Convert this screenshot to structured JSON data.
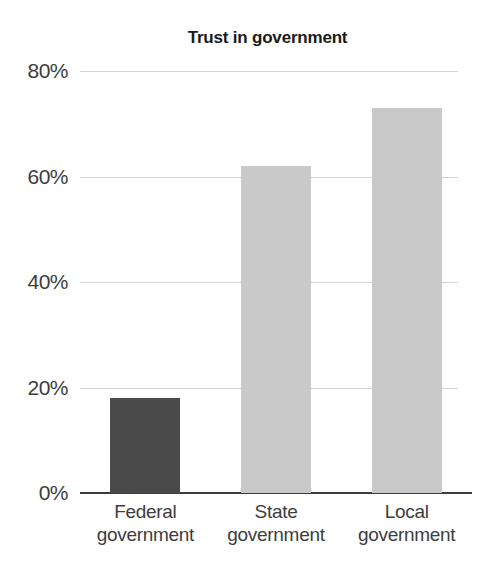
{
  "chart_data": {
    "type": "bar",
    "title": "Trust in government",
    "xlabel": "",
    "ylabel": "",
    "categories": [
      "Federal government",
      "State government",
      "Local government"
    ],
    "category_lines": [
      [
        "Federal",
        "government"
      ],
      [
        "State",
        "government"
      ],
      [
        "Local",
        "government"
      ]
    ],
    "values": [
      18,
      62,
      73
    ],
    "value_labels": [
      "18%",
      "62%",
      "73%"
    ],
    "ylim": [
      0,
      80
    ],
    "yticks": [
      0,
      20,
      40,
      60,
      80
    ],
    "ytick_labels": [
      "0%",
      "20%",
      "40%",
      "60%",
      "80%"
    ],
    "grid": true,
    "legend": "none",
    "bar_colors": [
      "#4a4a4a",
      "#c9c9c9",
      "#c9c9c9"
    ],
    "gridline_color": "#d4d4d4",
    "axis_color": "#3c3c3c",
    "text_color": "#3d3d3d",
    "title_color": "#1a1a1a",
    "background_color": "#ffffff"
  }
}
